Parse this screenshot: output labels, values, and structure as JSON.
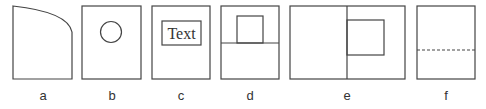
{
  "panels": [
    {
      "id": "a",
      "label": "a",
      "description": "rectangle with curved top-right corner"
    },
    {
      "id": "b",
      "label": "b",
      "description": "rectangle with circle"
    },
    {
      "id": "c",
      "label": "c",
      "description": "rectangle with text box",
      "text": "Text"
    },
    {
      "id": "d",
      "label": "d",
      "description": "rectangle split horizontally with inner box on upper half"
    },
    {
      "id": "e",
      "label": "e",
      "description": "wide rectangle split vertically with box in right half"
    },
    {
      "id": "f",
      "label": "f",
      "description": "rectangle with dashed horizontal line"
    }
  ],
  "colors": {
    "stroke": "#444444",
    "background": "#ffffff"
  }
}
